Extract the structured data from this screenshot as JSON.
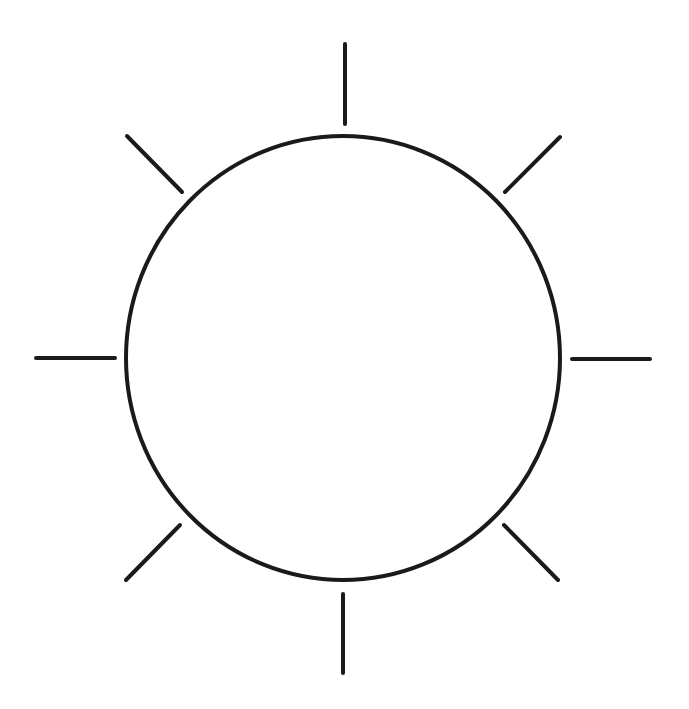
{
  "figure": {
    "stroke_color": "#1a1a1a",
    "background_color": "#ffffff",
    "stroke_width": 4,
    "circle": {
      "cx": 343,
      "cy": 358,
      "rx": 217,
      "ry": 222
    },
    "rays": [
      {
        "name": "ray-top",
        "x1": 345,
        "y1": 44,
        "x2": 345,
        "y2": 124
      },
      {
        "name": "ray-top-right",
        "x1": 505,
        "y1": 192,
        "x2": 560,
        "y2": 137
      },
      {
        "name": "ray-right",
        "x1": 572,
        "y1": 359,
        "x2": 650,
        "y2": 359
      },
      {
        "name": "ray-bottom-right",
        "x1": 504,
        "y1": 525,
        "x2": 558,
        "y2": 580
      },
      {
        "name": "ray-bottom",
        "x1": 343,
        "y1": 594,
        "x2": 343,
        "y2": 673
      },
      {
        "name": "ray-bottom-left",
        "x1": 180,
        "y1": 525,
        "x2": 126,
        "y2": 580
      },
      {
        "name": "ray-left",
        "x1": 36,
        "y1": 358,
        "x2": 115,
        "y2": 358
      },
      {
        "name": "ray-top-left",
        "x1": 127,
        "y1": 136,
        "x2": 182,
        "y2": 192
      }
    ]
  }
}
